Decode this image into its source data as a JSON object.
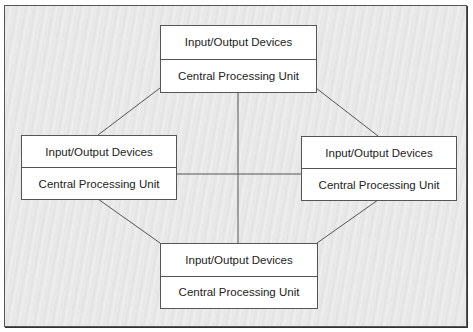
{
  "diagram": {
    "type": "network-topology",
    "nodes": [
      {
        "id": "top",
        "line1": "Input/Output Devices",
        "line2": "Central Processing Unit"
      },
      {
        "id": "left",
        "line1": "Input/Output Devices",
        "line2": "Central Processing Unit"
      },
      {
        "id": "right",
        "line1": "Input/Output Devices",
        "line2": "Central Processing Unit"
      },
      {
        "id": "bottom",
        "line1": "Input/Output Devices",
        "line2": "Central Processing Unit"
      }
    ],
    "edges": [
      [
        "top",
        "left"
      ],
      [
        "top",
        "right"
      ],
      [
        "top",
        "bottom"
      ],
      [
        "left",
        "right"
      ],
      [
        "left",
        "bottom"
      ],
      [
        "right",
        "bottom"
      ]
    ],
    "colors": {
      "line": "#555555",
      "box_fill": "#ffffff",
      "background": "#e8e8e8"
    }
  }
}
